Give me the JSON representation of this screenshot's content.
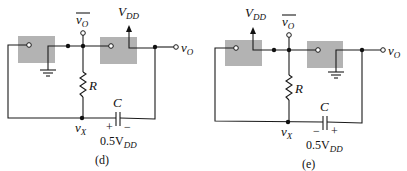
{
  "figure": {
    "panels": [
      {
        "id": "d",
        "caption": "(d)",
        "labels": {
          "vo_bar": "v",
          "vo_bar_sub": "O",
          "vdd": "V",
          "vdd_sub": "DD",
          "vo": "v",
          "vo_sub": "O",
          "resistor": "R",
          "capacitor": "C",
          "vx": "v",
          "vx_sub": "X",
          "cap_left_sign": "+",
          "cap_right_sign": "−",
          "cap_voltage": "0.5V",
          "cap_voltage_sub": "DD"
        },
        "supply_on": "second-inverter",
        "ground_on": "first-inverter"
      },
      {
        "id": "e",
        "caption": "(e)",
        "labels": {
          "vo_bar": "v",
          "vo_bar_sub": "O",
          "vdd": "V",
          "vdd_sub": "DD",
          "vo": "v",
          "vo_sub": "O",
          "resistor": "R",
          "capacitor": "C",
          "vx": "v",
          "vx_sub": "X",
          "cap_left_sign": "−",
          "cap_right_sign": "+",
          "cap_voltage": "0.5V",
          "cap_voltage_sub": "DD"
        },
        "supply_on": "first-inverter",
        "ground_on": "second-inverter"
      }
    ],
    "colors": {
      "block_fill": "#b3b3b3",
      "wire": "#1a1a1a",
      "background": "#ffffff"
    }
  }
}
